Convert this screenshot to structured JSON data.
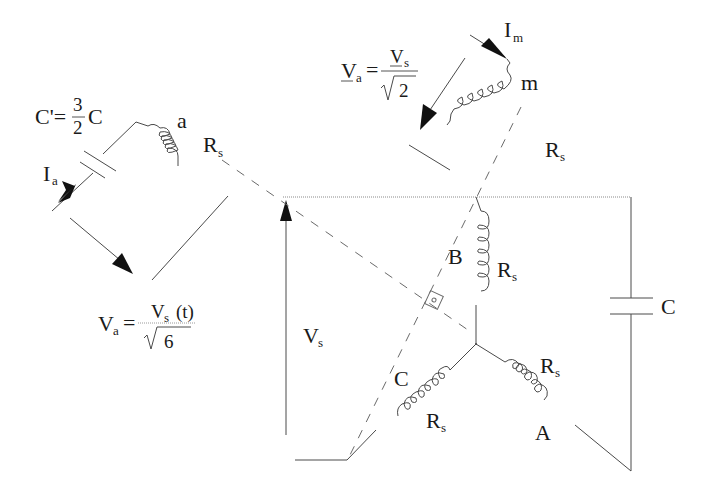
{
  "diagram": {
    "labels": {
      "c_prime_lhs": "C'=",
      "c_prime_num": "3",
      "c_prime_den": "2",
      "c_prime_rhs": "C",
      "coil_a": "a",
      "rs_a": "R",
      "rs_sub": "s",
      "ia": "I",
      "ia_sub": "a",
      "va_bottom_lhs": "V",
      "va_bottom_lhs_sub": "a",
      "va_bottom_num": "V",
      "va_bottom_num_sub": "s",
      "va_bottom_num_tail": "(t)",
      "va_bottom_den": "6",
      "va_top_lhs": "V",
      "va_top_lhs_sub": "a",
      "va_top_num": "V",
      "va_top_num_sub": "s",
      "va_top_den": "2",
      "im": "I",
      "im_sub": "m",
      "coil_m": "m",
      "rs_m": "R",
      "vs": "V",
      "vs_sub": "s",
      "phase_b": "B",
      "phase_c": "C",
      "phase_a": "A",
      "rs_b": "R",
      "rs_c": "R",
      "rs_phase_a": "R",
      "cap_c": "C",
      "equals": "="
    },
    "colors": {
      "line": "#4a4a4a",
      "arrow": "#111111",
      "text": "#1a1a1a",
      "background": "#ffffff"
    }
  }
}
